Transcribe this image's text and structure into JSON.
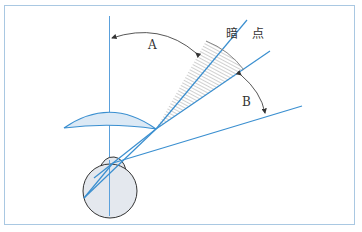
{
  "diagram": {
    "labels": {
      "angle_a": "A",
      "angle_b": "B",
      "blind_spot": "暗　点"
    },
    "colors": {
      "frame": "#a9c8e2",
      "ray_lines": "#3a8fd0",
      "axis_line": "#5aa0dc",
      "eye_fill": "#e4e8ee",
      "eye_stroke": "#333333",
      "lens_fill": "#dce9f5",
      "hatch": "#888888",
      "arrow_arc": "#444444",
      "text": "#333333"
    },
    "elements": [
      "outer frame",
      "vertical visual axis",
      "eyeball with cornea",
      "lens/meniscus shape",
      "three rays from eye",
      "hatched blind spot sector",
      "angle arc A",
      "angle arc B"
    ]
  }
}
